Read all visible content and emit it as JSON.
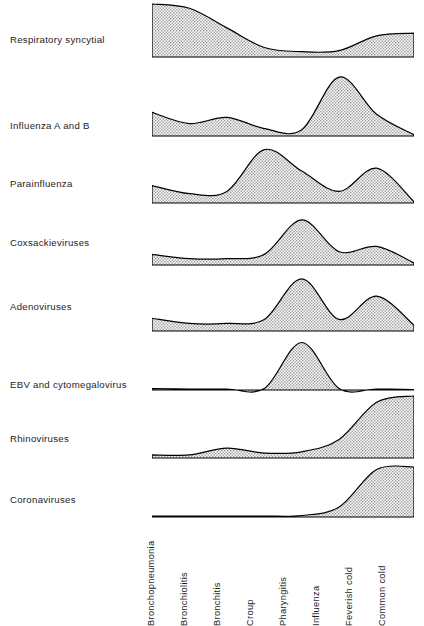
{
  "figure": {
    "caption": "",
    "axis_labels_rotated": true
  },
  "chart_data": {
    "type": "area",
    "title": "",
    "xlabel": "",
    "ylabel": "",
    "ylim": [
      0,
      1
    ],
    "grid": false,
    "legend": "none",
    "categories": [
      "Bronchopneumonia",
      "Bronchiolitis",
      "Bronchitis",
      "Croup",
      "Pharyngitis",
      "Influenza",
      "Feverish cold",
      "Common cold"
    ],
    "series": [
      {
        "name": "Respiratory syncytial",
        "values": [
          1.0,
          0.92,
          0.55,
          0.18,
          0.1,
          0.12,
          0.4,
          0.45
        ]
      },
      {
        "name": "Influenza A and B",
        "values": [
          0.38,
          0.2,
          0.3,
          0.12,
          0.1,
          0.95,
          0.35,
          0.02
        ]
      },
      {
        "name": "Parainfluenza",
        "values": [
          0.3,
          0.16,
          0.2,
          0.92,
          0.55,
          0.2,
          0.6,
          0.02
        ]
      },
      {
        "name": "Coxsackieviruses",
        "values": [
          0.2,
          0.12,
          0.12,
          0.2,
          0.85,
          0.25,
          0.35,
          0.04
        ]
      },
      {
        "name": "Adenoviruses",
        "values": [
          0.22,
          0.13,
          0.13,
          0.2,
          0.9,
          0.2,
          0.6,
          0.1
        ]
      },
      {
        "name": "EBV and cytomegalovirus",
        "values": [
          0.03,
          0.02,
          0.02,
          0.03,
          0.95,
          0.03,
          0.02,
          0.01
        ]
      },
      {
        "name": "Rhinoviruses",
        "values": [
          0.05,
          0.05,
          0.16,
          0.08,
          0.1,
          0.3,
          0.9,
          1.0
        ]
      },
      {
        "name": "Coronaviruses",
        "values": [
          0.02,
          0.02,
          0.02,
          0.02,
          0.03,
          0.2,
          0.95,
          1.0
        ]
      }
    ]
  },
  "rows": [
    {
      "label": "Respiratory syncytial"
    },
    {
      "label": "Influenza A and B"
    },
    {
      "label": "Parainfluenza"
    },
    {
      "label": "Coxsackieviruses"
    },
    {
      "label": "Adenoviruses"
    },
    {
      "label": "EBV and cytomegalovirus"
    },
    {
      "label": "Rhinoviruses"
    },
    {
      "label": "Coronaviruses"
    }
  ],
  "x_axis": {
    "labels": [
      "Bronchopneumonia",
      "Bronchiolitis",
      "Bronchitis",
      "Croup",
      "Pharyngitis",
      "Influenza",
      "Feverish cold",
      "Common cold"
    ]
  },
  "style": {
    "line_color": "#000000",
    "fill_pattern": "stipple-dots",
    "fill_color": "#cfcfcf",
    "background": "#ffffff"
  }
}
